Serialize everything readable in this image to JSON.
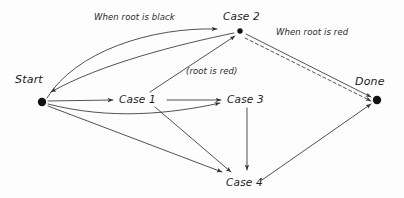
{
  "diagram": {
    "background_color": "#fdfdfd",
    "stroke_color": "#333333",
    "text_color": "#1a1a1a",
    "nodes": [
      {
        "id": "start",
        "label": "Start",
        "x": 42,
        "y": 102,
        "shape": "dot",
        "label_x": 15,
        "label_y": 74
      },
      {
        "id": "case1",
        "label": "Case 1",
        "x": 141,
        "y": 100,
        "shape": "text",
        "label_x": 119,
        "label_y": 93
      },
      {
        "id": "case2",
        "label": "Case 2",
        "x": 240,
        "y": 31,
        "shape": "dot",
        "label_x": 223,
        "label_y": 11
      },
      {
        "id": "case3",
        "label": "Case 3",
        "x": 247,
        "y": 100,
        "shape": "text",
        "label_x": 227,
        "label_y": 93
      },
      {
        "id": "case4",
        "label": "Case 4",
        "x": 247,
        "y": 183,
        "shape": "text",
        "label_x": 226,
        "label_y": 176
      },
      {
        "id": "done",
        "label": "Done",
        "x": 377,
        "y": 100,
        "shape": "dot",
        "label_x": 355,
        "label_y": 76
      }
    ],
    "edge_labels": [
      {
        "id": "when-root-is-black",
        "text": "When root is black",
        "x": 94,
        "y": 12
      },
      {
        "id": "when-root-is-red",
        "text": "When root is red",
        "x": 276,
        "y": 27
      },
      {
        "id": "root-is-red",
        "text": "(root is red)",
        "x": 186,
        "y": 67
      }
    ],
    "edges": [
      {
        "id": "start-to-case2",
        "from": "start",
        "to": "case2",
        "style": "solid",
        "label": "When root is black"
      },
      {
        "id": "case2-to-start",
        "from": "case2",
        "to": "start",
        "style": "solid",
        "label": ""
      },
      {
        "id": "start-to-case1",
        "from": "start",
        "to": "case1",
        "style": "solid",
        "label": ""
      },
      {
        "id": "start-to-case3",
        "from": "start",
        "to": "case3",
        "style": "solid",
        "label": ""
      },
      {
        "id": "start-to-case4",
        "from": "start",
        "to": "case4",
        "style": "solid",
        "label": ""
      },
      {
        "id": "case1-to-case2",
        "from": "case1",
        "to": "case2",
        "style": "solid",
        "label": "(root is red)"
      },
      {
        "id": "case1-to-case3",
        "from": "case1",
        "to": "case3",
        "style": "solid",
        "label": ""
      },
      {
        "id": "case1-to-case4",
        "from": "case1",
        "to": "case4",
        "style": "solid",
        "label": ""
      },
      {
        "id": "case3-to-case4",
        "from": "case3",
        "to": "case4",
        "style": "solid",
        "label": ""
      },
      {
        "id": "case2-to-done",
        "from": "case2",
        "to": "done",
        "style": "solid",
        "label": "When root is red"
      },
      {
        "id": "case2-to-done-alt",
        "from": "case2",
        "to": "done",
        "style": "dashed",
        "label": ""
      },
      {
        "id": "case4-to-done",
        "from": "case4",
        "to": "done",
        "style": "solid",
        "label": ""
      }
    ]
  }
}
